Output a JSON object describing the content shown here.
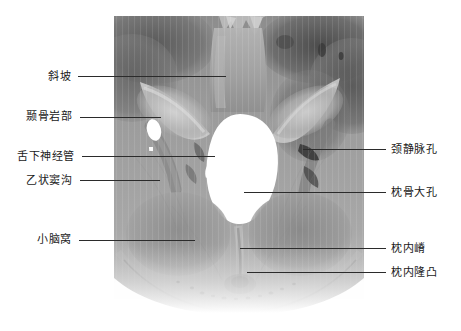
{
  "figure": {
    "type": "anatomical-photograph",
    "width": 461,
    "height": 331,
    "background_color": "#ffffff",
    "photo": {
      "left": 114,
      "top": 16,
      "width": 250,
      "height": 297,
      "base_gray": "#9a9a9a",
      "dark_gray": "#4f4f4f",
      "light_gray": "#cfcfcf",
      "foramen_white": "#ffffff"
    },
    "leader_color": "#2b2b2b"
  },
  "labels": {
    "left": [
      {
        "id": "clivus",
        "text": "斜坡",
        "text_x": 48,
        "text_y": 70,
        "line_x": 78,
        "line_y": 76,
        "line_w": 148
      },
      {
        "id": "petrous-temporal",
        "text": "颞骨岩部",
        "text_x": 26,
        "text_y": 110,
        "line_x": 80,
        "line_y": 117,
        "line_w": 81
      },
      {
        "id": "hypoglossal-canal",
        "text": "舌下神经管",
        "text_x": 17,
        "text_y": 150,
        "line_x": 82,
        "line_y": 156,
        "line_w": 133
      },
      {
        "id": "sigmoid-sulcus",
        "text": "乙状窦沟",
        "text_x": 26,
        "text_y": 174,
        "line_x": 80,
        "line_y": 180,
        "line_w": 80
      },
      {
        "id": "cerebellar-fossa",
        "text": "小脑窝",
        "text_x": 37,
        "text_y": 233,
        "line_x": 79,
        "line_y": 240,
        "line_w": 116
      }
    ],
    "right": [
      {
        "id": "jugular-foramen",
        "text": "颈静脉孔",
        "text_x": 391,
        "text_y": 143,
        "line_x": 303,
        "line_y": 149,
        "line_w": 83
      },
      {
        "id": "foramen-magnum",
        "text": "枕骨大孔",
        "text_x": 391,
        "text_y": 186,
        "line_x": 244,
        "line_y": 192,
        "line_w": 142
      },
      {
        "id": "internal-occipital-crest",
        "text": "枕内嵴",
        "text_x": 391,
        "text_y": 242,
        "line_x": 240,
        "line_y": 248,
        "line_w": 146
      },
      {
        "id": "internal-occipital-protuberance",
        "text": "枕内隆凸",
        "text_x": 391,
        "text_y": 266,
        "line_x": 247,
        "line_y": 272,
        "line_w": 139
      }
    ]
  }
}
